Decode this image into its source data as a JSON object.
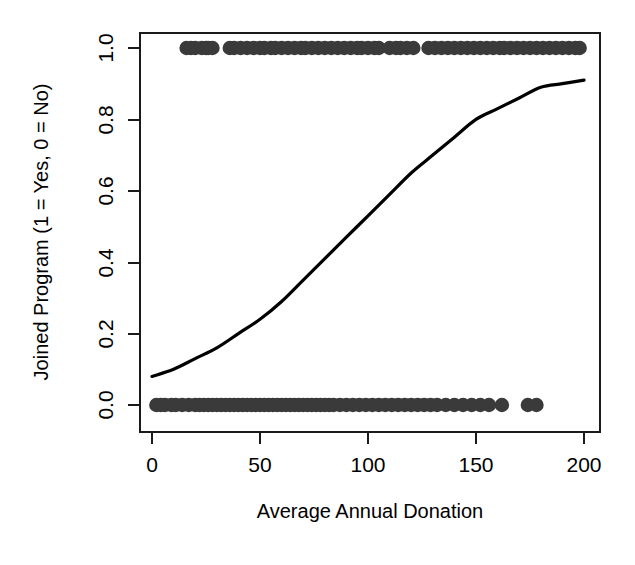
{
  "chart_data": {
    "type": "scatter",
    "title": "",
    "xlabel": "Average Annual Donation",
    "ylabel": "Joined Program (1 = Yes, 0 = No)",
    "xlim": [
      0,
      200
    ],
    "ylim": [
      0.0,
      1.0
    ],
    "grid": false,
    "legend": null,
    "x_ticks": [
      0,
      50,
      100,
      150,
      200
    ],
    "x_tick_labels": [
      "0",
      "50",
      "100",
      "150",
      "200"
    ],
    "y_ticks": [
      0.0,
      0.2,
      0.4,
      0.6,
      0.8,
      1.0
    ],
    "y_tick_labels": [
      "0.0",
      "0.2",
      "0.4",
      "0.6",
      "0.8",
      "1.0"
    ],
    "point_color": "#3a3a3a",
    "curve_color": "#000000",
    "series": [
      {
        "name": "Joined (y = 1)",
        "type": "scatter",
        "y_value": 1.0,
        "x": [
          16,
          18,
          20,
          23,
          25,
          26,
          28,
          36,
          38,
          41,
          44,
          47,
          50,
          52,
          55,
          57,
          60,
          63,
          66,
          69,
          71,
          74,
          77,
          80,
          83,
          86,
          89,
          92,
          95,
          97,
          100,
          103,
          105,
          110,
          113,
          115,
          118,
          121,
          128,
          131,
          134,
          137,
          140,
          143,
          146,
          149,
          152,
          155,
          158,
          161,
          163,
          166,
          169,
          172,
          175,
          178,
          181,
          184,
          187,
          190,
          193,
          196,
          198
        ]
      },
      {
        "name": "Did not join (y = 0)",
        "type": "scatter",
        "y_value": 0.0,
        "x": [
          2,
          4,
          6,
          9,
          11,
          14,
          17,
          20,
          22,
          24,
          26,
          28,
          30,
          32,
          34,
          36,
          38,
          40,
          42,
          44,
          46,
          48,
          50,
          52,
          54,
          56,
          58,
          60,
          62,
          64,
          66,
          68,
          70,
          72,
          74,
          76,
          78,
          80,
          82,
          84,
          87,
          90,
          93,
          96,
          99,
          102,
          105,
          108,
          111,
          114,
          117,
          120,
          123,
          126,
          129,
          132,
          136,
          140,
          144,
          148,
          152,
          156,
          162,
          174,
          178
        ]
      },
      {
        "name": "Logistic fit",
        "type": "line",
        "x": [
          0,
          10,
          20,
          30,
          40,
          50,
          60,
          70,
          80,
          90,
          100,
          110,
          120,
          130,
          140,
          150,
          160,
          170,
          180,
          190,
          200
        ],
        "y": [
          0.08,
          0.1,
          0.13,
          0.16,
          0.2,
          0.24,
          0.29,
          0.35,
          0.41,
          0.47,
          0.53,
          0.59,
          0.65,
          0.7,
          0.75,
          0.8,
          0.83,
          0.86,
          0.89,
          0.9,
          0.91
        ]
      }
    ]
  },
  "axes": {
    "x_title": "Average Annual Donation",
    "y_title": "Joined Program (1 = Yes, 0 = No)"
  }
}
